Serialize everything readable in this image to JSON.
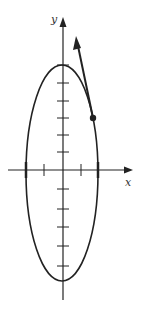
{
  "diagram": {
    "x_axis_label": "x",
    "y_axis_label": "y",
    "colors": {
      "stroke": "#222222",
      "label": "#333333",
      "background": "#ffffff"
    },
    "shape": "vertical ellipse centered at origin",
    "tangent_point": "point on ellipse in first quadrant with tangent vector arrow"
  }
}
